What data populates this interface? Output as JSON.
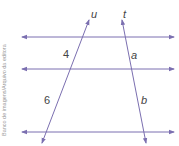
{
  "credit": "Banco de imagens/Arquivo da editora",
  "colors": {
    "lines": "#7b6fb0",
    "text": "#444444"
  },
  "parallel_lines": [
    {
      "name": "line-1",
      "y": 37
    },
    {
      "name": "line-2",
      "y": 69
    },
    {
      "name": "line-3",
      "y": 132
    }
  ],
  "transversals": [
    {
      "label": "u",
      "from": [
        42,
        143
      ],
      "to": [
        89,
        20
      ]
    },
    {
      "label": "t",
      "from": [
        146,
        143
      ],
      "to": [
        122,
        20
      ]
    }
  ],
  "segment_labels": {
    "u_upper": "4",
    "u_lower": "6",
    "t_upper": "a",
    "t_lower": "b"
  }
}
